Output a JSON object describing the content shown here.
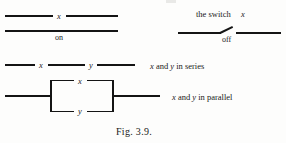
{
  "figure": {
    "caption": "Fig. 3.9.",
    "ink_color": "#141414",
    "background_color": "#fdfdfc"
  },
  "rows": {
    "switch_on": {
      "variable_label": "x",
      "state_label": "on"
    },
    "switch_off": {
      "title": "the switch ",
      "title_variable": "x",
      "state_label": "off"
    },
    "series": {
      "first_variable": "x",
      "second_variable": "y",
      "description_prefix": "x",
      "description_middle": " and ",
      "description_variable": "y",
      "description_suffix": " in series"
    },
    "parallel": {
      "top_variable": "x",
      "bottom_variable": "y",
      "description_prefix": "x",
      "description_middle": " and ",
      "description_variable": "y",
      "description_suffix": " in parallel"
    }
  }
}
